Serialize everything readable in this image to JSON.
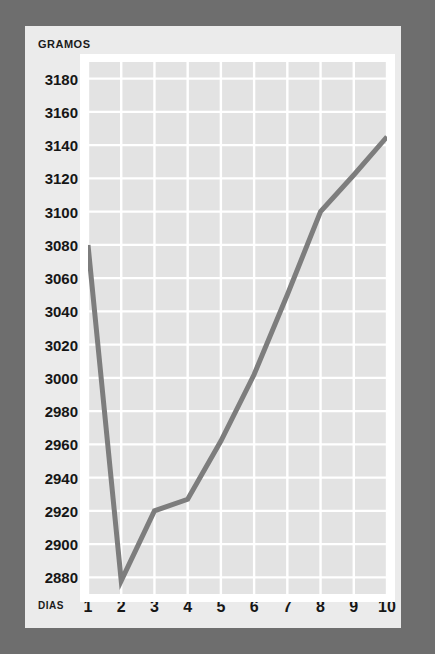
{
  "chart_data": {
    "type": "line",
    "title": "",
    "subtitle": "",
    "xlabel": "DIAS",
    "ylabel": "GRAMOS",
    "x": [
      1,
      2,
      3,
      4,
      5,
      6,
      7,
      8,
      9,
      10
    ],
    "categories": [
      "1",
      "2",
      "3",
      "4",
      "5",
      "6",
      "7",
      "8",
      "9",
      "10"
    ],
    "values": [
      3080,
      2878,
      2920,
      2927,
      2962,
      3002,
      3050,
      3100,
      3122,
      3145
    ],
    "series": [
      {
        "name": "peso",
        "values": [
          3080,
          2878,
          2920,
          2927,
          2962,
          3002,
          3050,
          3100,
          3122,
          3145
        ]
      }
    ],
    "xlim": [
      1,
      10
    ],
    "ylim": [
      2870,
      3190
    ],
    "ytick_values": [
      3180,
      3160,
      3140,
      3120,
      3100,
      3080,
      3060,
      3040,
      3020,
      3000,
      2980,
      2960,
      2940,
      2920,
      2900,
      2880
    ],
    "ytick_labels": [
      "3180",
      "3160",
      "3140",
      "3120",
      "3100",
      "3080",
      "3060",
      "3040",
      "3020",
      "3000",
      "2980",
      "2960",
      "2940",
      "2920",
      "2900",
      "2880"
    ],
    "xtick_labels": [
      "1",
      "2",
      "3",
      "4",
      "5",
      "6",
      "7",
      "8",
      "9",
      "10"
    ],
    "ystep": 20,
    "grid": true,
    "grid_color": "#ffffff",
    "legend": false,
    "legend_position": "none",
    "annotations": []
  },
  "style": {
    "border_color": "#6e6e6e",
    "card_color": "#ebebeb",
    "plot_frame_color": "#ffffff",
    "plot_background": "#e3e3e3",
    "line_color": "#7d7d7d",
    "text_color": "#161616"
  }
}
